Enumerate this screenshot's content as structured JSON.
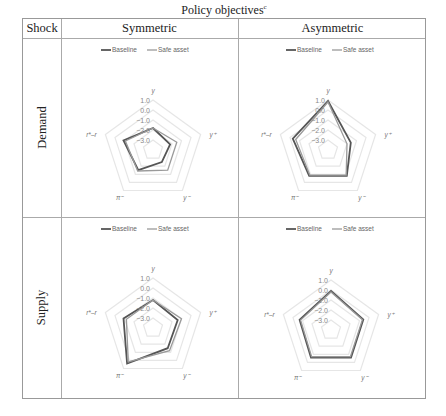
{
  "title": "Policy objectives",
  "title_sup": "c",
  "table": {
    "col_header_shock": "Shock",
    "col_headers": [
      "Symmetric",
      "Asymmetric"
    ],
    "row_headers": [
      "Demand",
      "Supply"
    ]
  },
  "legend": {
    "baseline": "Baseline",
    "safe_asset": "Safe asset"
  },
  "axes": [
    "y",
    "y+",
    "y−",
    "π−",
    "r*−r"
  ],
  "axis_labels_display": {
    "y": "y",
    "yplus": "y⁺",
    "yminus": "y⁻",
    "piminus": "π⁻",
    "rr": "r*–r"
  },
  "ticks": [
    "1.0",
    "0.0",
    "−1.0",
    "−2.0",
    "−3.0"
  ],
  "colors": {
    "baseline": "#555555",
    "safe_asset": "#9a9a9a",
    "grid": "#e6e6e6"
  },
  "chart_data": [
    {
      "type": "radar",
      "title": "Demand shock – Symmetric",
      "categories": [
        "y",
        "y+",
        "y−",
        "π−",
        "r*−r"
      ],
      "series": [
        {
          "name": "Baseline",
          "values": [
            -1.8,
            -2.2,
            -2.5,
            -1.5,
            -0.9
          ]
        },
        {
          "name": "Safe asset",
          "values": [
            -1.8,
            -1.5,
            -1.5,
            -1.4,
            -1.1
          ]
        }
      ],
      "rlim": [
        -4.0,
        1.0
      ],
      "ticks": [
        1.0,
        0.0,
        -1.0,
        -2.0,
        -3.0
      ],
      "legend_position": "top"
    },
    {
      "type": "radar",
      "title": "Demand shock – Asymmetric",
      "categories": [
        "y",
        "y+",
        "y−",
        "π−",
        "r*−r"
      ],
      "series": [
        {
          "name": "Baseline",
          "values": [
            0.9,
            -1.6,
            -0.8,
            -0.8,
            -0.3
          ]
        },
        {
          "name": "Safe asset",
          "values": [
            0.8,
            -2.0,
            -0.9,
            -0.9,
            -0.6
          ]
        }
      ],
      "rlim": [
        -4.0,
        1.0
      ],
      "ticks": [
        1.0,
        0.0,
        -1.0,
        -2.0,
        -3.0
      ],
      "legend_position": "top"
    },
    {
      "type": "radar",
      "title": "Supply shock – Symmetric",
      "categories": [
        "y",
        "y+",
        "y−",
        "π−",
        "r*−r"
      ],
      "series": [
        {
          "name": "Baseline",
          "values": [
            -1.2,
            -1.4,
            -1.5,
            0.4,
            -0.9
          ]
        },
        {
          "name": "Safe asset",
          "values": [
            -1.2,
            -1.0,
            -1.2,
            0.2,
            -1.2
          ]
        }
      ],
      "rlim": [
        -4.0,
        1.0
      ],
      "ticks": [
        1.0,
        0.0,
        -1.0,
        -2.0,
        -3.0
      ],
      "legend_position": "top"
    },
    {
      "type": "radar",
      "title": "Supply shock – Asymmetric",
      "categories": [
        "y",
        "y+",
        "y−",
        "π−",
        "r*−r"
      ],
      "series": [
        {
          "name": "Baseline",
          "values": [
            -0.1,
            -0.6,
            -0.6,
            -0.6,
            -0.7
          ]
        },
        {
          "name": "Safe asset",
          "values": [
            -0.2,
            -0.7,
            -0.7,
            -0.7,
            -0.8
          ]
        }
      ],
      "rlim": [
        -4.0,
        1.0
      ],
      "ticks": [
        1.0,
        0.0,
        -1.0,
        -2.0,
        -3.0
      ],
      "legend_position": "top"
    }
  ]
}
